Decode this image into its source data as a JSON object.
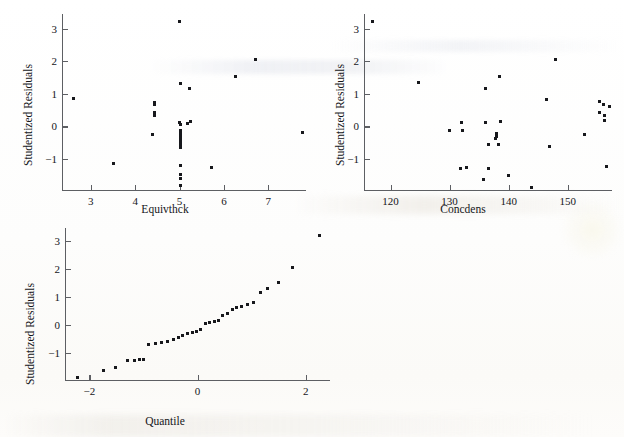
{
  "figure": {
    "kind": "residual-diagnostic-plots",
    "background_color": "#ffffff",
    "ink_color": "#17181c",
    "axis_color": "#5d5f63"
  },
  "panels": [
    {
      "name": "residuals-vs-equivthck",
      "xlabel": "Equivthck",
      "ylabel": "Studentized Residuals",
      "xticks": [
        "3",
        "4",
        "5",
        "6",
        "7"
      ],
      "yticks": [
        "3",
        "2",
        "1",
        "0",
        "−1"
      ]
    },
    {
      "name": "residuals-vs-concdens",
      "xlabel": "Concdens",
      "ylabel": "Studentized Residuals",
      "xticks": [
        "120",
        "130",
        "140",
        "150"
      ],
      "yticks": [
        "3",
        "2",
        "1",
        "0",
        "−1"
      ]
    },
    {
      "name": "normal-quantile-plot",
      "xlabel": "Quantile",
      "ylabel": "Studentized Residuals",
      "xticks": [
        "−2",
        "0",
        "2"
      ],
      "yticks": [
        "3",
        "2",
        "1",
        "0",
        "−1"
      ]
    }
  ],
  "chart_data": [
    {
      "type": "scatter",
      "name": "residuals-vs-equivthck",
      "title": "",
      "xlabel": "Equivthck",
      "ylabel": "Studentized Residuals",
      "xlim": [
        2.35,
        7.85
      ],
      "ylim": [
        -1.95,
        3.45
      ],
      "xticks": [
        3,
        4,
        5,
        6,
        7
      ],
      "yticks": [
        -1,
        0,
        1,
        2,
        3
      ],
      "grid": false,
      "legend": null,
      "points": [
        [
          2.62,
          0.87
        ],
        [
          3.5,
          -1.15
        ],
        [
          4.43,
          0.72
        ],
        [
          4.43,
          0.66
        ],
        [
          4.43,
          0.42
        ],
        [
          4.43,
          0.35
        ],
        [
          4.4,
          -0.24
        ],
        [
          5.0,
          3.22
        ],
        [
          5.01,
          1.32
        ],
        [
          5.22,
          1.17
        ],
        [
          5.0,
          0.12
        ],
        [
          5.01,
          0.06
        ],
        [
          5.25,
          0.15
        ],
        [
          5.18,
          0.1
        ],
        [
          5.01,
          -0.13
        ],
        [
          5.01,
          -0.2
        ],
        [
          5.01,
          -0.27
        ],
        [
          5.01,
          -0.33
        ],
        [
          5.01,
          -0.4
        ],
        [
          5.01,
          -0.5
        ],
        [
          5.01,
          -0.58
        ],
        [
          5.01,
          -0.66
        ],
        [
          5.01,
          -1.21
        ],
        [
          5.01,
          -1.46
        ],
        [
          5.01,
          -1.6
        ],
        [
          5.01,
          -1.82
        ],
        [
          5.73,
          -1.26
        ],
        [
          6.27,
          1.53
        ],
        [
          6.72,
          2.05
        ],
        [
          7.78,
          -0.2
        ]
      ]
    },
    {
      "type": "scatter",
      "name": "residuals-vs-concdens",
      "title": "",
      "xlabel": "Concdens",
      "ylabel": "Studentized Residuals",
      "xlim": [
        115.5,
        157.5
      ],
      "ylim": [
        -1.95,
        3.45
      ],
      "xticks": [
        120,
        130,
        140,
        150
      ],
      "yticks": [
        -1,
        0,
        1,
        2,
        3
      ],
      "grid": false,
      "legend": null,
      "points": [
        [
          117.0,
          3.22
        ],
        [
          124.8,
          1.35
        ],
        [
          130.0,
          -0.13
        ],
        [
          132.0,
          0.12
        ],
        [
          132.2,
          -0.11
        ],
        [
          131.8,
          -1.28
        ],
        [
          132.9,
          -1.25
        ],
        [
          136.1,
          1.17
        ],
        [
          136.0,
          0.12
        ],
        [
          136.6,
          -0.55
        ],
        [
          136.6,
          -1.3
        ],
        [
          135.8,
          -1.63
        ],
        [
          137.9,
          -0.26
        ],
        [
          137.9,
          -0.32
        ],
        [
          137.8,
          -0.37
        ],
        [
          138.0,
          -0.22
        ],
        [
          138.3,
          -0.55
        ],
        [
          138.5,
          1.54
        ],
        [
          138.6,
          0.16
        ],
        [
          139.9,
          -1.5
        ],
        [
          143.9,
          -1.88
        ],
        [
          146.4,
          0.82
        ],
        [
          146.9,
          -0.6
        ],
        [
          148.0,
          2.05
        ],
        [
          152.9,
          -0.25
        ],
        [
          155.3,
          0.76
        ],
        [
          155.4,
          0.44
        ],
        [
          156.0,
          0.68
        ],
        [
          156.3,
          0.33
        ],
        [
          156.3,
          0.17
        ],
        [
          156.6,
          -1.22
        ],
        [
          157.1,
          0.6
        ]
      ]
    },
    {
      "type": "scatter",
      "name": "normal-quantile-plot",
      "title": "",
      "xlabel": "Quantile",
      "ylabel": "Studentized Residuals",
      "xlim": [
        -2.45,
        2.45
      ],
      "ylim": [
        -1.95,
        3.45
      ],
      "xticks": [
        -2,
        0,
        2
      ],
      "yticks": [
        -1,
        0,
        1,
        2,
        3
      ],
      "grid": false,
      "legend": null,
      "points": [
        [
          -2.22,
          -1.86
        ],
        [
          -1.74,
          -1.62
        ],
        [
          -1.52,
          -1.5
        ],
        [
          -1.3,
          -1.27
        ],
        [
          -1.17,
          -1.25
        ],
        [
          -1.08,
          -1.23
        ],
        [
          -0.99,
          -1.21
        ],
        [
          -0.9,
          -0.69
        ],
        [
          -0.78,
          -0.66
        ],
        [
          -0.67,
          -0.6
        ],
        [
          -0.55,
          -0.57
        ],
        [
          -0.44,
          -0.52
        ],
        [
          -0.36,
          -0.43
        ],
        [
          -0.27,
          -0.36
        ],
        [
          -0.19,
          -0.3
        ],
        [
          -0.1,
          -0.25
        ],
        [
          -0.02,
          -0.21
        ],
        [
          0.06,
          -0.14
        ],
        [
          0.15,
          0.06
        ],
        [
          0.23,
          0.1
        ],
        [
          0.31,
          0.13
        ],
        [
          0.39,
          0.16
        ],
        [
          0.47,
          0.33
        ],
        [
          0.55,
          0.4
        ],
        [
          0.64,
          0.56
        ],
        [
          0.73,
          0.62
        ],
        [
          0.82,
          0.66
        ],
        [
          0.92,
          0.73
        ],
        [
          1.03,
          0.82
        ],
        [
          1.17,
          1.17
        ],
        [
          1.3,
          1.3
        ],
        [
          1.49,
          1.53
        ],
        [
          1.75,
          2.04
        ],
        [
          2.25,
          3.18
        ]
      ]
    }
  ]
}
